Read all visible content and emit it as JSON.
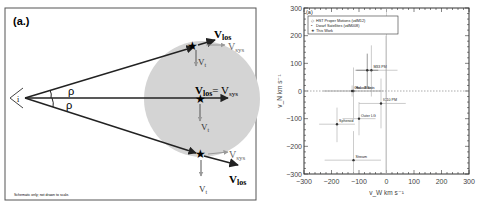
{
  "schematic": {
    "panel_label": "(a.)",
    "observer_label": "i",
    "angle_label_top": "ρ",
    "angle_label_bottom": "ρ",
    "top_star": {
      "vlos": "V",
      "vlos_sub": "los",
      "vsys": "V",
      "vsys_sub": "sys",
      "vt": "V",
      "vt_sub": "t"
    },
    "center_star": {
      "vlos": "V",
      "vlos_sub": "los",
      "eq": "= V",
      "vsys_sub": "sys",
      "vt": "V",
      "vt_sub": "t"
    },
    "bottom_star": {
      "vlos": "V",
      "vlos_sub": "los",
      "vsys": "V",
      "vsys_sub": "sys",
      "vt": "V",
      "vt_sub": "t"
    },
    "footnote": "Schematic only; not drawn to scale.",
    "colors": {
      "halo": "#d4d4d4",
      "frame": "#555555",
      "arrow": "#222222",
      "vsys_arrow": "#999999"
    }
  },
  "plot": {
    "panel_label": "(a)",
    "legend": [
      {
        "label": "HST Proper Motions (vdM12)",
        "marker": "open-diamond"
      },
      {
        "label": "Dwarf Satellites (vdM008)",
        "marker": "filled-dot"
      },
      {
        "label": "This Work",
        "marker": "star"
      }
    ],
    "xlabel": "v_W  km s⁻¹",
    "ylabel": "v_N  km s⁻¹",
    "x_ticks": [
      "−300",
      "−200",
      "−100",
      "0",
      "100",
      "200",
      "300"
    ],
    "y_ticks": [
      "300",
      "200",
      "100",
      "0",
      "−100",
      "−200",
      "−300"
    ]
  },
  "chart_data": {
    "type": "scatter",
    "title": "(a)",
    "xlabel": "v_W km s^-1",
    "ylabel": "v_N km s^-1",
    "xlim": [
      -300,
      300
    ],
    "ylim": [
      -300,
      300
    ],
    "grid": false,
    "reference_lines": {
      "x": 0,
      "y": 0,
      "style": "dotted"
    },
    "legend_position": "upper-left",
    "points": [
      {
        "label": "Halo Stars",
        "x": -120,
        "y": 0,
        "xerr": [
          -230,
          -10
        ],
        "yerr": [
          -100,
          85
        ]
      },
      {
        "label": "Obs. all Sats",
        "x": -125,
        "y": 0,
        "xerr": [
          -230,
          -20
        ],
        "yerr": [
          -20,
          20
        ]
      },
      {
        "label": "M33 PM",
        "x": -55,
        "y": 75,
        "xerr": [
          -115,
          40
        ],
        "yerr": [
          -20,
          165
        ]
      },
      {
        "label": "This Work",
        "x": -70,
        "y": 75,
        "xerr": [
          -110,
          -30
        ],
        "yerr": [
          15,
          135
        ]
      },
      {
        "label": "IC10 PM",
        "x": -20,
        "y": -45,
        "xerr": [
          -100,
          70
        ],
        "yerr": [
          -135,
          45
        ]
      },
      {
        "label": "Outer LG",
        "x": -100,
        "y": -100,
        "xerr": [
          -160,
          -40
        ],
        "yerr": [
          -160,
          -40
        ]
      },
      {
        "label": "Spheroid",
        "x": -180,
        "y": -120,
        "xerr": [
          -245,
          -115
        ],
        "yerr": [
          -185,
          -60
        ]
      },
      {
        "label": "Stream",
        "x": -120,
        "y": -250,
        "xerr": [
          -225,
          -20
        ],
        "yerr": [
          -300,
          -145
        ]
      },
      {
        "label": "Vertical error band",
        "x": -2,
        "y": 0,
        "xerr": [
          -2,
          -2
        ],
        "yerr": [
          -300,
          200
        ]
      }
    ]
  }
}
